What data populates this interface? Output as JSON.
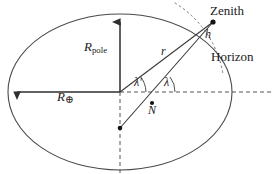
{
  "figure": {
    "type": "geometry-diagram",
    "canvas": {
      "width": 278,
      "height": 174
    },
    "colors": {
      "stroke": "#3a3a3a",
      "ellipse_stroke": "#4a4a4a",
      "dashed": "#555555",
      "text": "#1a1a1a",
      "background": "#ffffff"
    }
  },
  "labels": {
    "zenith": "Zenith",
    "horizon": "Horizon",
    "r_pole_symbol": "R",
    "r_pole_subscript": "pole",
    "r_earth_symbol": "R",
    "r_earth_subscript": "⊕",
    "radius_r": "r",
    "height_h": "h",
    "lambda_prime": "λ′",
    "lambda": "λ",
    "point_n": "N"
  },
  "geometry": {
    "ellipse": {
      "cx": 120,
      "cy": 92,
      "rx": 112,
      "ry": 78
    },
    "center_point": {
      "x": 120,
      "y": 92
    },
    "zenith_point": {
      "x": 213,
      "y": 22
    },
    "n_point": {
      "x": 152,
      "y": 103
    },
    "lower_origin_point": {
      "x": 120,
      "y": 128
    },
    "r_pole_arrow": {
      "x1": 120,
      "y1": 92,
      "x2": 120,
      "y2": 15
    },
    "r_earth_arrow": {
      "x1": 120,
      "y1": 92,
      "x2": 9,
      "y2": 92
    },
    "horizontal_dashed": {
      "x1": 120,
      "y1": 92,
      "x2": 272,
      "y2": 92
    },
    "vertical_dashed": {
      "x1": 120,
      "y1": 92,
      "x2": 120,
      "y2": 172
    },
    "geocentric_line": {
      "x1": 120,
      "y1": 92,
      "x2": 213,
      "y2": 22
    },
    "geodetic_line": {
      "x1": 120,
      "y1": 128,
      "x2": 213,
      "y2": 22
    },
    "horizon_arc": {
      "cx": 120,
      "cy": 92,
      "r": 104,
      "start_deg": -58,
      "end_deg": -8
    }
  }
}
